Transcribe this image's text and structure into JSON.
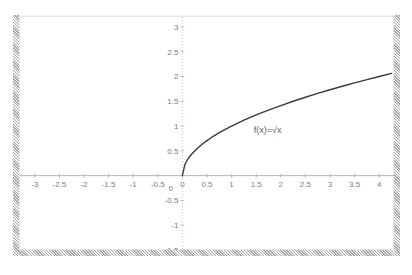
{
  "slide": {
    "title": "The radical function."
  },
  "figure": {
    "name": "square-root-function-graph"
  },
  "chart_data": {
    "type": "line",
    "title": "The radical function.",
    "subtitle": "",
    "xlabel": "",
    "ylabel": "",
    "xlim": [
      -3.3,
      4.3
    ],
    "ylim": [
      -1.5,
      3.2
    ],
    "grid": false,
    "legend_position": "none",
    "x_ticks": [
      -3,
      -2.5,
      -2,
      -1.5,
      -1,
      -0.5,
      0,
      0.5,
      1,
      1.5,
      2,
      2.5,
      3,
      3.5,
      4
    ],
    "x_tick_labels": [
      "-3",
      "-2.5",
      "-2",
      "-1.5",
      "-1",
      "-0.5",
      "0",
      "0.5",
      "1",
      "1.5",
      "2",
      "2.5",
      "3",
      "3.5",
      "4"
    ],
    "y_ticks": [
      3,
      2.5,
      2,
      1.5,
      1,
      0.5,
      0,
      -0.5,
      -1,
      -1.5
    ],
    "y_tick_labels": [
      "3",
      "2.5",
      "2",
      "1.5",
      "1",
      "0.5",
      "0",
      "-0.5",
      "-1",
      "-1.5"
    ],
    "annotations": [
      {
        "text": "f(x)=√x",
        "x": 1.45,
        "y": 0.93
      }
    ],
    "series": [
      {
        "name": "f(x)=√x",
        "color": "#3a3a3a",
        "domain": [
          0,
          4.3
        ],
        "x": [
          0,
          0.05,
          0.1,
          0.15,
          0.2,
          0.3,
          0.4,
          0.5,
          0.6,
          0.75,
          0.9,
          1,
          1.25,
          1.5,
          1.75,
          2,
          2.25,
          2.5,
          2.75,
          3,
          3.25,
          3.5,
          3.75,
          4,
          4.25
        ],
        "values": [
          0,
          0.224,
          0.316,
          0.387,
          0.447,
          0.548,
          0.632,
          0.707,
          0.775,
          0.866,
          0.949,
          1,
          1.118,
          1.225,
          1.323,
          1.414,
          1.5,
          1.581,
          1.658,
          1.732,
          1.803,
          1.871,
          1.936,
          2,
          2.062
        ]
      }
    ]
  },
  "axes": {
    "x_axis_label": "x-axis",
    "y_axis_label": "y-axis"
  }
}
